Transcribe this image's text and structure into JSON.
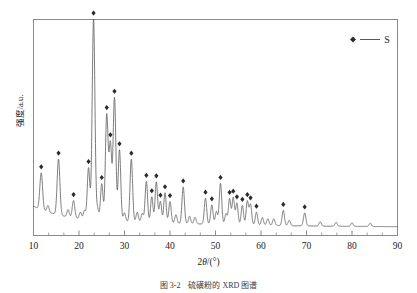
{
  "figure": {
    "caption": "图 3-2　硫磺粉的 XRD 图谱",
    "background_color": "#ffffff",
    "line_color": "#555555",
    "marker_color": "#2b2b2b",
    "axis_color": "#7a7a7a"
  },
  "legend": {
    "position": "top-right",
    "marker_icon": "diamond-marker",
    "line_icon": "legend-line",
    "label": "S"
  },
  "chart_data": {
    "type": "line",
    "title": "",
    "subtitle": "",
    "xlabel": "2θ/(°)",
    "ylabel": "强度/a.u.",
    "xlim": [
      10,
      90
    ],
    "ylim": [
      0,
      100
    ],
    "xticks": [
      10,
      20,
      30,
      40,
      50,
      60,
      70,
      80,
      90
    ],
    "xtick_labels": [
      "10",
      "20",
      "30",
      "40",
      "50",
      "60",
      "70",
      "80",
      "90"
    ],
    "minor_ticks_per_interval": 2,
    "yticks": [],
    "ytick_labels": [],
    "grid": false,
    "legend_position": "upper right",
    "series": [
      {
        "name": "S",
        "baseline": [
          {
            "x": 10.0,
            "y": 13.5
          },
          {
            "x": 11.0,
            "y": 12.6
          },
          {
            "x": 12.5,
            "y": 11.3
          },
          {
            "x": 14.0,
            "y": 10.3
          },
          {
            "x": 16.0,
            "y": 9.2
          },
          {
            "x": 18.0,
            "y": 8.4
          },
          {
            "x": 20.0,
            "y": 7.8
          },
          {
            "x": 23.0,
            "y": 7.2
          },
          {
            "x": 27.0,
            "y": 6.8
          },
          {
            "x": 32.0,
            "y": 6.3
          },
          {
            "x": 38.0,
            "y": 5.8
          },
          {
            "x": 45.0,
            "y": 5.4
          },
          {
            "x": 52.0,
            "y": 5.1
          },
          {
            "x": 60.0,
            "y": 4.8
          },
          {
            "x": 68.0,
            "y": 4.5
          },
          {
            "x": 75.0,
            "y": 4.3
          },
          {
            "x": 82.0,
            "y": 4.2
          },
          {
            "x": 90.0,
            "y": 4.1
          }
        ],
        "peaks": [
          {
            "x": 11.7,
            "height": 17.0,
            "width": 0.3,
            "marked": true
          },
          {
            "x": 13.2,
            "height": 3.0,
            "width": 0.25,
            "marked": false
          },
          {
            "x": 15.5,
            "height": 26.0,
            "width": 0.3,
            "marked": true
          },
          {
            "x": 17.6,
            "height": 3.5,
            "width": 0.25,
            "marked": false
          },
          {
            "x": 18.8,
            "height": 8.0,
            "width": 0.28,
            "marked": true
          },
          {
            "x": 20.3,
            "height": 3.0,
            "width": 0.25,
            "marked": false
          },
          {
            "x": 21.2,
            "height": 4.0,
            "width": 0.25,
            "marked": false
          },
          {
            "x": 22.1,
            "height": 24.0,
            "width": 0.28,
            "marked": true
          },
          {
            "x": 23.2,
            "height": 93.0,
            "width": 0.3,
            "marked": true
          },
          {
            "x": 24.1,
            "height": 5.0,
            "width": 0.25,
            "marked": false
          },
          {
            "x": 25.0,
            "height": 17.0,
            "width": 0.27,
            "marked": true
          },
          {
            "x": 26.1,
            "height": 49.0,
            "width": 0.3,
            "marked": true
          },
          {
            "x": 26.9,
            "height": 35.0,
            "width": 0.28,
            "marked": true
          },
          {
            "x": 27.8,
            "height": 57.0,
            "width": 0.3,
            "marked": true
          },
          {
            "x": 28.9,
            "height": 33.0,
            "width": 0.28,
            "marked": true
          },
          {
            "x": 30.0,
            "height": 4.0,
            "width": 0.25,
            "marked": false
          },
          {
            "x": 31.5,
            "height": 29.0,
            "width": 0.28,
            "marked": true
          },
          {
            "x": 32.8,
            "height": 4.5,
            "width": 0.25,
            "marked": false
          },
          {
            "x": 33.9,
            "height": 4.0,
            "width": 0.25,
            "marked": false
          },
          {
            "x": 34.8,
            "height": 19.0,
            "width": 0.27,
            "marked": true
          },
          {
            "x": 36.0,
            "height": 12.0,
            "width": 0.26,
            "marked": true
          },
          {
            "x": 37.0,
            "height": 19.0,
            "width": 0.27,
            "marked": true
          },
          {
            "x": 37.9,
            "height": 10.0,
            "width": 0.26,
            "marked": true
          },
          {
            "x": 38.9,
            "height": 14.0,
            "width": 0.26,
            "marked": true
          },
          {
            "x": 40.0,
            "height": 10.0,
            "width": 0.26,
            "marked": true
          },
          {
            "x": 41.3,
            "height": 4.0,
            "width": 0.25,
            "marked": false
          },
          {
            "x": 42.9,
            "height": 17.0,
            "width": 0.27,
            "marked": true
          },
          {
            "x": 44.3,
            "height": 3.5,
            "width": 0.25,
            "marked": false
          },
          {
            "x": 45.5,
            "height": 3.0,
            "width": 0.25,
            "marked": false
          },
          {
            "x": 47.8,
            "height": 12.0,
            "width": 0.26,
            "marked": true
          },
          {
            "x": 49.2,
            "height": 9.0,
            "width": 0.26,
            "marked": true
          },
          {
            "x": 50.2,
            "height": 6.0,
            "width": 0.25,
            "marked": false
          },
          {
            "x": 51.1,
            "height": 19.0,
            "width": 0.27,
            "marked": true
          },
          {
            "x": 52.3,
            "height": 5.0,
            "width": 0.25,
            "marked": false
          },
          {
            "x": 53.1,
            "height": 12.0,
            "width": 0.26,
            "marked": true
          },
          {
            "x": 53.9,
            "height": 12.5,
            "width": 0.26,
            "marked": true
          },
          {
            "x": 54.7,
            "height": 10.0,
            "width": 0.26,
            "marked": true
          },
          {
            "x": 55.9,
            "height": 9.0,
            "width": 0.26,
            "marked": true
          },
          {
            "x": 57.0,
            "height": 11.0,
            "width": 0.26,
            "marked": true
          },
          {
            "x": 57.7,
            "height": 9.5,
            "width": 0.26,
            "marked": true
          },
          {
            "x": 59.0,
            "height": 6.0,
            "width": 0.25,
            "marked": true
          },
          {
            "x": 60.3,
            "height": 3.5,
            "width": 0.25,
            "marked": false
          },
          {
            "x": 61.5,
            "height": 3.0,
            "width": 0.25,
            "marked": false
          },
          {
            "x": 62.8,
            "height": 3.0,
            "width": 0.25,
            "marked": false
          },
          {
            "x": 64.9,
            "height": 7.0,
            "width": 0.26,
            "marked": true
          },
          {
            "x": 66.2,
            "height": 2.5,
            "width": 0.25,
            "marked": false
          },
          {
            "x": 69.6,
            "height": 6.0,
            "width": 0.26,
            "marked": true
          },
          {
            "x": 73.0,
            "height": 2.0,
            "width": 0.25,
            "marked": false
          },
          {
            "x": 76.5,
            "height": 1.8,
            "width": 0.25,
            "marked": false
          },
          {
            "x": 80.0,
            "height": 1.6,
            "width": 0.25,
            "marked": false
          },
          {
            "x": 84.0,
            "height": 1.5,
            "width": 0.25,
            "marked": false
          }
        ]
      }
    ]
  }
}
